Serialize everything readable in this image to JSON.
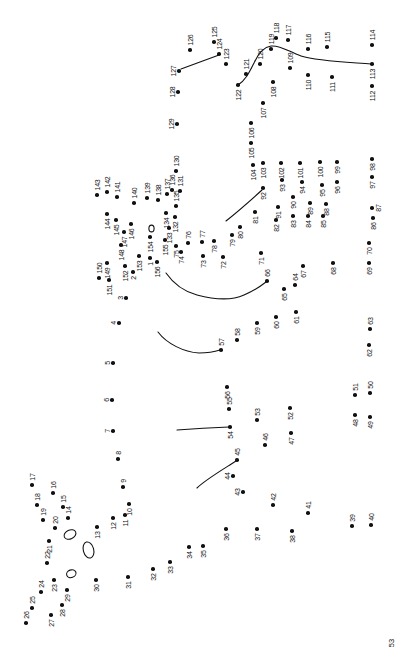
{
  "page": {
    "width": 399,
    "height": 653,
    "background": "#ffffff",
    "ink_color": "#111111",
    "page_number": "53"
  },
  "puzzle": {
    "type": "connect-the-dots",
    "dot_count": 156,
    "dot_diameter_px": 3.6,
    "label_font_px": 7,
    "points": [
      [
        1,
        150,
        258,
        "b"
      ],
      [
        2,
        133,
        272,
        "b"
      ],
      [
        3,
        126,
        298,
        "l"
      ],
      [
        4,
        119,
        323,
        "l"
      ],
      [
        5,
        113,
        363,
        "l"
      ],
      [
        6,
        112,
        400,
        "l"
      ],
      [
        7,
        113,
        431,
        "l"
      ],
      [
        8,
        118,
        459,
        "a"
      ],
      [
        9,
        123,
        487,
        "a"
      ],
      [
        10,
        129,
        504,
        "b"
      ],
      [
        11,
        125,
        515,
        "b"
      ],
      [
        12,
        113,
        518,
        "b"
      ],
      [
        13,
        97,
        527,
        "b"
      ],
      [
        14,
        68,
        518,
        "a"
      ],
      [
        15,
        63,
        507,
        "a"
      ],
      [
        16,
        53,
        493,
        "a"
      ],
      [
        17,
        32,
        485,
        "a"
      ],
      [
        18,
        37,
        505,
        "a"
      ],
      [
        19,
        43,
        520,
        "a"
      ],
      [
        20,
        55,
        528,
        "a"
      ],
      [
        21,
        49,
        541,
        "b"
      ],
      [
        22,
        47,
        563,
        "a"
      ],
      [
        23,
        54,
        580,
        "b"
      ],
      [
        24,
        41,
        592,
        "a"
      ],
      [
        25,
        32,
        608,
        "a"
      ],
      [
        26,
        26,
        623,
        "a"
      ],
      [
        27,
        51,
        615,
        "b"
      ],
      [
        28,
        62,
        605,
        "b"
      ],
      [
        29,
        67,
        590,
        "b"
      ],
      [
        30,
        96,
        580,
        "b"
      ],
      [
        31,
        128,
        577,
        "b"
      ],
      [
        32,
        153,
        569,
        "b"
      ],
      [
        33,
        170,
        562,
        "b"
      ],
      [
        34,
        189,
        547,
        "b"
      ],
      [
        35,
        203,
        546,
        "b"
      ],
      [
        36,
        226,
        529,
        "b"
      ],
      [
        37,
        257,
        529,
        "b"
      ],
      [
        38,
        292,
        531,
        "b"
      ],
      [
        39,
        352,
        526,
        "a"
      ],
      [
        40,
        371,
        525,
        "a"
      ],
      [
        41,
        308,
        513,
        "a"
      ],
      [
        42,
        273,
        505,
        "a"
      ],
      [
        43,
        243,
        492,
        "l"
      ],
      [
        44,
        233,
        476,
        "l"
      ],
      [
        45,
        237,
        460,
        "a"
      ],
      [
        46,
        265,
        445,
        "a"
      ],
      [
        47,
        291,
        433,
        "b"
      ],
      [
        48,
        355,
        415,
        "b"
      ],
      [
        49,
        370,
        417,
        "b"
      ],
      [
        50,
        370,
        393,
        "a"
      ],
      [
        51,
        355,
        395,
        "a"
      ],
      [
        52,
        290,
        408,
        "b"
      ],
      [
        53,
        257,
        420,
        "a"
      ],
      [
        54,
        230,
        427,
        "b"
      ],
      [
        55,
        229,
        409,
        "a"
      ],
      [
        56,
        227,
        387,
        "b"
      ],
      [
        57,
        221,
        350,
        "a"
      ],
      [
        58,
        237,
        340,
        "a"
      ],
      [
        59,
        257,
        323,
        "b"
      ],
      [
        60,
        276,
        317,
        "b"
      ],
      [
        61,
        296,
        312,
        "b"
      ],
      [
        62,
        369,
        345,
        "b"
      ],
      [
        63,
        370,
        329,
        "a"
      ],
      [
        64,
        295,
        285,
        "a"
      ],
      [
        65,
        284,
        289,
        "b"
      ],
      [
        66,
        267,
        281,
        "a"
      ],
      [
        67,
        303,
        266,
        "b"
      ],
      [
        68,
        333,
        263,
        "b"
      ],
      [
        69,
        369,
        263,
        "b"
      ],
      [
        70,
        369,
        243,
        "b"
      ],
      [
        71,
        261,
        253,
        "b"
      ],
      [
        72,
        223,
        257,
        "b"
      ],
      [
        73,
        203,
        256,
        "b"
      ],
      [
        74,
        181,
        252,
        "b"
      ],
      [
        75,
        176,
        246,
        "b"
      ],
      [
        76,
        188,
        243,
        "a"
      ],
      [
        77,
        202,
        242,
        "a"
      ],
      [
        78,
        214,
        241,
        "b"
      ],
      [
        79,
        232,
        235,
        "b"
      ],
      [
        80,
        240,
        227,
        "b"
      ],
      [
        81,
        255,
        212,
        "b"
      ],
      [
        82,
        276,
        220,
        "b"
      ],
      [
        83,
        293,
        216,
        "b"
      ],
      [
        84,
        308,
        216,
        "b"
      ],
      [
        85,
        323,
        216,
        "b"
      ],
      [
        86,
        373,
        218,
        "b"
      ],
      [
        87,
        372,
        208,
        "r"
      ],
      [
        88,
        326,
        204,
        "b"
      ],
      [
        89,
        310,
        203,
        "b"
      ],
      [
        90,
        293,
        197,
        "b"
      ],
      [
        91,
        278,
        207,
        "b"
      ],
      [
        92,
        263,
        188,
        "b"
      ],
      [
        93,
        282,
        180,
        "b"
      ],
      [
        94,
        302,
        182,
        "b"
      ],
      [
        95,
        322,
        185,
        "b"
      ],
      [
        96,
        337,
        182,
        "b"
      ],
      [
        97,
        372,
        177,
        "b"
      ],
      [
        98,
        372,
        159,
        "b"
      ],
      [
        99,
        337,
        162,
        "b"
      ],
      [
        100,
        320,
        162,
        "b"
      ],
      [
        101,
        300,
        163,
        "b"
      ],
      [
        102,
        281,
        163,
        "b"
      ],
      [
        103,
        263,
        163,
        "b"
      ],
      [
        104,
        253,
        165,
        "b"
      ],
      [
        105,
        251,
        143,
        "b"
      ],
      [
        106,
        251,
        123,
        "b"
      ],
      [
        107,
        263,
        103,
        "b"
      ],
      [
        108,
        273,
        82,
        "b"
      ],
      [
        109,
        290,
        68,
        "a"
      ],
      [
        110,
        308,
        75,
        "b"
      ],
      [
        111,
        332,
        77,
        "b"
      ],
      [
        112,
        372,
        86,
        "b"
      ],
      [
        113,
        372,
        64,
        "b"
      ],
      [
        114,
        372,
        45,
        "a"
      ],
      [
        115,
        327,
        47,
        "a"
      ],
      [
        116,
        308,
        49,
        "a"
      ],
      [
        117,
        288,
        40,
        "a"
      ],
      [
        118,
        276,
        38,
        "a"
      ],
      [
        119,
        271,
        49,
        "a"
      ],
      [
        120,
        260,
        64,
        "a"
      ],
      [
        121,
        246,
        74,
        "a"
      ],
      [
        122,
        238,
        85,
        "b"
      ],
      [
        123,
        226,
        64,
        "a"
      ],
      [
        124,
        219,
        54,
        "a"
      ],
      [
        125,
        214,
        42,
        "a"
      ],
      [
        126,
        190,
        50,
        "a"
      ],
      [
        127,
        179,
        71,
        "l"
      ],
      [
        128,
        178,
        92,
        "l"
      ],
      [
        129,
        177,
        124,
        "l"
      ],
      [
        130,
        176,
        171,
        "a"
      ],
      [
        131,
        180,
        191,
        "a"
      ],
      [
        132,
        175,
        217,
        "b"
      ],
      [
        133,
        169,
        228,
        "b"
      ],
      [
        134,
        166,
        213,
        "b"
      ],
      [
        135,
        176,
        206,
        "a"
      ],
      [
        136,
        172,
        190,
        "a"
      ],
      [
        137,
        167,
        194,
        "a"
      ],
      [
        138,
        158,
        200,
        "a"
      ],
      [
        139,
        147,
        198,
        "a"
      ],
      [
        140,
        134,
        203,
        "a"
      ],
      [
        141,
        117,
        197,
        "a"
      ],
      [
        142,
        107,
        192,
        "a"
      ],
      [
        143,
        97,
        195,
        "a"
      ],
      [
        144,
        107,
        214,
        "b"
      ],
      [
        145,
        116,
        220,
        "b"
      ],
      [
        146,
        131,
        224,
        "b"
      ],
      [
        147,
        124,
        232,
        "b"
      ],
      [
        148,
        121,
        245,
        "b"
      ],
      [
        149,
        107,
        263,
        "b"
      ],
      [
        150,
        99,
        278,
        "a"
      ],
      [
        151,
        109,
        280,
        "b"
      ],
      [
        152,
        125,
        266,
        "b"
      ],
      [
        153,
        139,
        256,
        "b"
      ],
      [
        154,
        150,
        237,
        "b"
      ],
      [
        155,
        165,
        240,
        "b"
      ],
      [
        156,
        157,
        262,
        "b"
      ]
    ],
    "curves": [
      "M181,69 Q200,62 219,55",
      "M238,85 C246,80 250,71 254,63 C258,54 263,47 271,46 C281,45 289,52 301,56 C317,61 344,62 371,64",
      "M226,221 C236,213 251,200 262,190",
      "M166,273 C173,283 182,291 197,295 C216,300 233,300 244,295 C253,291 261,286 266,282",
      "M158,332 C167,344 184,352 199,353 C208,353 214,352 220,350",
      "M177,430 Q203,428 229,427",
      "M197,488 C205,480 222,470 236,461"
    ],
    "ellipses": [
      {
        "cx": 151.5,
        "cy": 228.5,
        "rx": 2.6,
        "ry": 3.4,
        "rot": 0
      },
      {
        "cx": 70,
        "cy": 534.5,
        "rx": 6.2,
        "ry": 4.4,
        "rot": -25
      },
      {
        "cx": 88.5,
        "cy": 550,
        "rx": 5.2,
        "ry": 8.2,
        "rot": -15
      },
      {
        "cx": 71.3,
        "cy": 573.7,
        "rx": 4.8,
        "ry": 3.8,
        "rot": -20
      }
    ]
  }
}
